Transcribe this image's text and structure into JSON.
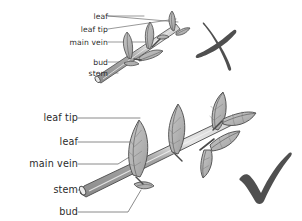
{
  "worksheet": {
    "title": "Labelling a twig: incorrect and correct leader lines",
    "background_color": "#ffffff",
    "text_color": "#2b2b2b",
    "leader_line_color": "#6d6d6d",
    "outline_color": "#4a4a4a",
    "leaf_fill": "#b5b5b5",
    "leaf_fill_light": "#c9c9c9",
    "stem_fill": "#9a9a9a",
    "stem_highlight": "#d8d8d8",
    "mark_color": "#4f4f4f"
  },
  "top_diagram": {
    "verdict": "incorrect",
    "verdict_mark": "cross-mark",
    "mark_glyph": "✗",
    "note": "leader lines cross each other and point at the wrong parts",
    "labels": [
      {
        "id": "leaf",
        "text": "leaf",
        "x": 80,
        "y": 17
      },
      {
        "id": "leaf-tip",
        "text": "leaf tip",
        "x": 80,
        "y": 30
      },
      {
        "id": "main-vein",
        "text": "main vein",
        "x": 80,
        "y": 43
      },
      {
        "id": "bud",
        "text": "bud",
        "x": 80,
        "y": 63
      },
      {
        "id": "stem",
        "text": "stem",
        "x": 80,
        "y": 74
      }
    ]
  },
  "bottom_diagram": {
    "verdict": "correct",
    "verdict_mark": "check-mark",
    "mark_glyph": "✓",
    "note": "leader lines are straight, parallel and do not cross",
    "labels": [
      {
        "id": "leaf-tip",
        "text": "leaf tip",
        "x": 72,
        "y": 118
      },
      {
        "id": "leaf",
        "text": "leaf",
        "x": 72,
        "y": 142
      },
      {
        "id": "main-vein",
        "text": "main vein",
        "x": 72,
        "y": 164
      },
      {
        "id": "stem",
        "text": "stem",
        "x": 72,
        "y": 190
      },
      {
        "id": "bud",
        "text": "bud",
        "x": 72,
        "y": 212
      }
    ]
  }
}
